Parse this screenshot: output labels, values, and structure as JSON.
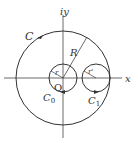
{
  "diagram": {
    "type": "complex-plane-contours",
    "axes": {
      "x_label": "x",
      "y_label": "iy",
      "origin_label": "O"
    },
    "contours": [
      {
        "name": "C",
        "label": "C",
        "radius_label": "R",
        "description": "large outer circle centered at origin"
      },
      {
        "name": "C0",
        "label": "C",
        "subscript": "0",
        "radius_label": "r",
        "description": "small circle around origin"
      },
      {
        "name": "C1",
        "label": "C",
        "subscript": "1",
        "radius_label": "r'",
        "description": "small circle on positive real axis"
      }
    ],
    "colors": {
      "stroke": "#333333",
      "background": "#ffffff"
    }
  }
}
